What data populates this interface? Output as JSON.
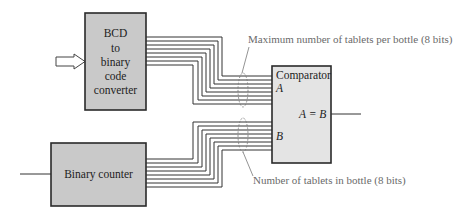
{
  "blocks": {
    "bcd_converter": {
      "lines": [
        "BCD",
        "to",
        "binary",
        "code",
        "converter"
      ]
    },
    "binary_counter": {
      "label": "Binary counter"
    },
    "comparator": {
      "title": "Comparator",
      "input_a": "A",
      "input_b": "B",
      "output": "A = B"
    }
  },
  "annotations": {
    "top_bus": "Maximum number of tablets per bottle (8 bits)",
    "bottom_bus": "Number of tablets in bottle (8 bits)"
  },
  "buses": {
    "top_bits": 8,
    "bottom_bits": 8
  },
  "colors": {
    "block_fill": "#c9c9c9",
    "comparator_fill": "#e4e4e4",
    "stroke": "#2a2a2a",
    "annotation": "#6a6a6a"
  }
}
